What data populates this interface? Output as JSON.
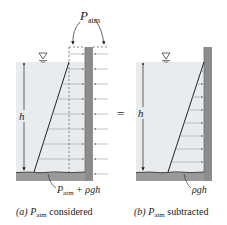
{
  "colors": {
    "water": "#e8ecee",
    "wall": "#8c8c8c",
    "wall_dark": "#6f6f6f",
    "ground": "#9a9a9a",
    "line": "#2a2a2a",
    "arrow": "#9a9a9a",
    "text": "#222222"
  },
  "diagram_a": {
    "label_P": "P",
    "label_P_sub": "atm",
    "depth_label": "h",
    "bottom_label_P": "P",
    "bottom_label_sub": "atm",
    "bottom_label_rest": " + ρgh",
    "caption_prefix": "(a) ",
    "caption_P": "P",
    "caption_sub": "atm",
    "caption_rest": " considered"
  },
  "equals_sign": "=",
  "diagram_b": {
    "depth_label": "h",
    "bottom_label": "ρgh",
    "caption_prefix": "(b) ",
    "caption_P": "P",
    "caption_sub": "atm",
    "caption_rest": " subtracted"
  },
  "free_surface_symbol": "▽"
}
